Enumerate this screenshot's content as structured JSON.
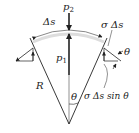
{
  "figure": {
    "type": "mechanics-diagram",
    "colors": {
      "line": "#222222",
      "arc": "#555555",
      "background": "#ffffff"
    }
  },
  "labels": {
    "p2": "p",
    "p2_sub": "2",
    "p1": "p",
    "p1_sub": "1",
    "delta_s": "Δs",
    "sigma_delta_s": "σ Δs",
    "theta_right": "θ",
    "radius": "R",
    "theta_center": "θ",
    "vertical_component": "σ Δs sin θ"
  }
}
